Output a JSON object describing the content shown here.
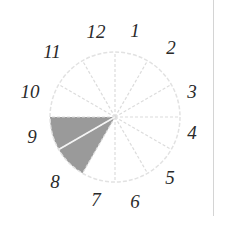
{
  "diagram": {
    "type": "clock-face-sector-diagram",
    "center": [
      115,
      117
    ],
    "radius": 65,
    "sectors": 12,
    "circle_stroke_color": "#e2e2e2",
    "spoke_stroke_color": "#dcdcdc",
    "shaded_fill_color": "#9a9a9a",
    "shaded_range": {
      "from_hour": 7,
      "to_hour": 9
    },
    "shaded_divider_hour": 8,
    "hour_labels": [
      {
        "text": "12",
        "x": 96,
        "y": 38
      },
      {
        "text": "1",
        "x": 135,
        "y": 37
      },
      {
        "text": "2",
        "x": 171,
        "y": 54
      },
      {
        "text": "3",
        "x": 192,
        "y": 98
      },
      {
        "text": "4",
        "x": 192,
        "y": 139
      },
      {
        "text": "5",
        "x": 170,
        "y": 184
      },
      {
        "text": "6",
        "x": 135,
        "y": 208
      },
      {
        "text": "7",
        "x": 96,
        "y": 206
      },
      {
        "text": "8",
        "x": 55,
        "y": 188
      },
      {
        "text": "9",
        "x": 32,
        "y": 143
      },
      {
        "text": "10",
        "x": 30,
        "y": 98
      },
      {
        "text": "11",
        "x": 52,
        "y": 58
      }
    ]
  },
  "layout": {
    "right_rule": {
      "x": 213,
      "height": 216,
      "color": "#d4d4d4"
    }
  }
}
